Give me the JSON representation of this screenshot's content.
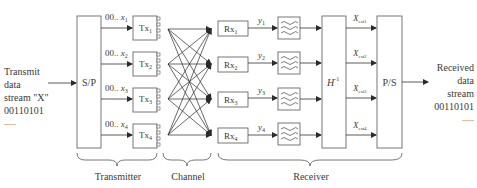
{
  "input": {
    "lines": [
      "Transmit",
      "data",
      "stream \"X\"",
      "00110101",
      "......"
    ]
  },
  "output": {
    "lines": [
      "Received",
      "data",
      "stream",
      "00110101",
      "......"
    ]
  },
  "blocks": {
    "sp": "S/P",
    "ps": "P/S",
    "hinv_base": "H",
    "hinv_sup": "-1"
  },
  "tx": [
    {
      "base": "Tx",
      "sub": "1",
      "input_prefix": "00.. ",
      "input_var": "x",
      "input_sub": "1"
    },
    {
      "base": "Tx",
      "sub": "2",
      "input_prefix": "00.. ",
      "input_var": "x",
      "input_sub": "2"
    },
    {
      "base": "Tx",
      "sub": "3",
      "input_prefix": "00.. ",
      "input_var": "x",
      "input_sub": "3"
    },
    {
      "base": "Tx",
      "sub": "4",
      "input_prefix": "00.. ",
      "input_var": "x",
      "input_sub": "4"
    }
  ],
  "rx": [
    {
      "base": "Rx",
      "sub": "1",
      "out_var": "y",
      "out_sub": "1"
    },
    {
      "base": "Rx",
      "sub": "2",
      "out_var": "y",
      "out_sub": "2"
    },
    {
      "base": "Rx",
      "sub": "3",
      "out_var": "y",
      "out_sub": "3"
    },
    {
      "base": "Rx",
      "sub": "4",
      "out_var": "y",
      "out_sub": "4"
    }
  ],
  "estimates": [
    {
      "var": "X",
      "sub": "est1"
    },
    {
      "var": "X",
      "sub": "est2"
    },
    {
      "var": "X",
      "sub": "est3"
    },
    {
      "var": "X",
      "sub": "est4"
    }
  ],
  "sections": {
    "transmitter": "Transmitter",
    "channel": "Channel",
    "receiver": "Receiver"
  }
}
